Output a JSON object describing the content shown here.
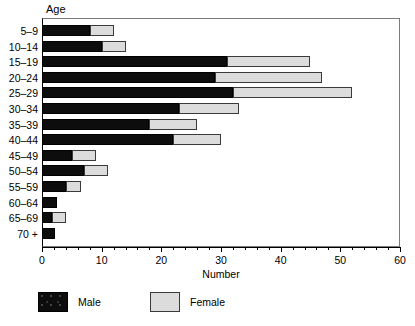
{
  "chart_data": {
    "type": "bar",
    "orientation": "horizontal",
    "stacked": true,
    "title": "",
    "xlabel": "Number",
    "ylabel": "Age",
    "xlim": [
      0,
      60
    ],
    "ylim": null,
    "grid": false,
    "legend_position": "bottom-left",
    "x_ticks": [
      0,
      10,
      20,
      30,
      40,
      50,
      60
    ],
    "x_tick_labels": [
      "0",
      "10",
      "20",
      "30",
      "40",
      "50",
      "60"
    ],
    "x_minor_tick_step": 2,
    "categories": [
      "5–9",
      "10–14",
      "15–19",
      "20–24",
      "25–29",
      "30–34",
      "35–39",
      "40–44",
      "45–49",
      "50–54",
      "55–59",
      "60–64",
      "65–69",
      "70 +"
    ],
    "series": [
      {
        "name": "Male",
        "color": "#0d0d0d",
        "values": [
          8,
          10,
          31,
          29,
          32,
          23,
          18,
          22,
          5,
          7,
          4,
          2.5,
          1.7,
          2.2
        ]
      },
      {
        "name": "Female",
        "color": "#dcdcdc",
        "values": [
          4,
          4,
          14,
          18,
          20,
          10,
          8,
          8,
          4,
          4,
          2.5,
          0,
          2.3,
          0
        ]
      }
    ],
    "totals": [
      12,
      14,
      45,
      47,
      52,
      33,
      26,
      30,
      9,
      11,
      6.5,
      2.5,
      4,
      2.2
    ]
  },
  "axes": {
    "age_title": "Age",
    "number_title": "Number"
  },
  "legend": {
    "items": [
      {
        "label": "Male",
        "swatch": "male-swatch"
      },
      {
        "label": "Female",
        "swatch": "female-swatch"
      }
    ]
  }
}
